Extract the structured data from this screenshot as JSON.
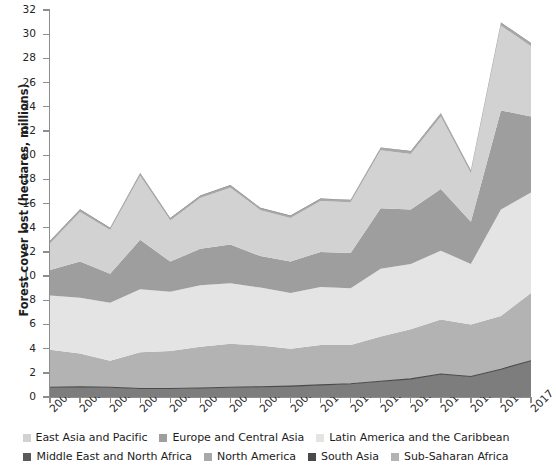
{
  "chart_data": {
    "type": "area",
    "stacked": true,
    "title": "",
    "xlabel": "",
    "ylabel": "Forest cover lost (hectares, millions)",
    "ylim": [
      0,
      32
    ],
    "ytick_step": 2,
    "yticks": [
      "0",
      "2",
      "4",
      "6",
      "8",
      "10",
      "12",
      "14",
      "16",
      "18",
      "20",
      "22",
      "24",
      "26",
      "28",
      "30",
      "32"
    ],
    "grid": false,
    "legend_position": "bottom",
    "categories": [
      "2001",
      "2002",
      "2003",
      "2004",
      "2005",
      "2006",
      "2007",
      "2008",
      "2009",
      "2010",
      "2011",
      "2012",
      "2013",
      "2014",
      "2015",
      "2016",
      "2017"
    ],
    "x": [
      2001,
      2002,
      2003,
      2004,
      2005,
      2006,
      2007,
      2008,
      2009,
      2010,
      2011,
      2012,
      2013,
      2014,
      2015,
      2016,
      2017
    ],
    "series": [
      {
        "name": "South Asia",
        "color": "#7d7d7d",
        "values": [
          0.8,
          0.85,
          0.8,
          0.7,
          0.7,
          0.75,
          0.8,
          0.85,
          0.9,
          1.0,
          1.1,
          1.3,
          1.5,
          1.9,
          1.7,
          2.3,
          3.0
        ]
      },
      {
        "name": "Sub-Saharan Africa",
        "color": "#b3b3b3",
        "values": [
          3.1,
          2.75,
          2.2,
          3.0,
          3.1,
          3.4,
          3.6,
          3.4,
          3.1,
          3.3,
          3.2,
          3.7,
          4.1,
          4.5,
          4.3,
          4.4,
          5.6
        ]
      },
      {
        "name": "Latin America and the Caribbean",
        "color": "#e4e4e4",
        "values": [
          4.5,
          4.6,
          4.8,
          5.2,
          4.9,
          5.1,
          5.0,
          4.8,
          4.6,
          4.8,
          4.7,
          5.6,
          5.4,
          5.7,
          5.0,
          8.8,
          8.3
        ]
      },
      {
        "name": "Europe and Central Asia",
        "color": "#9e9e9e",
        "values": [
          2.1,
          3.0,
          2.4,
          4.1,
          2.5,
          3.0,
          3.2,
          2.6,
          2.6,
          2.9,
          2.9,
          5.0,
          4.5,
          5.1,
          3.5,
          8.2,
          6.3
        ]
      },
      {
        "name": "East Asia and Pacific",
        "color": "#d2d2d2",
        "values": [
          2.2,
          4.1,
          3.6,
          5.3,
          3.4,
          4.2,
          4.7,
          3.8,
          3.6,
          4.2,
          4.2,
          4.8,
          4.6,
          6.0,
          4.0,
          7.0,
          5.8
        ]
      },
      {
        "name": "North America",
        "color": "#a8a8a8",
        "values": [
          0.18,
          0.18,
          0.16,
          0.18,
          0.16,
          0.18,
          0.18,
          0.16,
          0.16,
          0.18,
          0.18,
          0.2,
          0.2,
          0.22,
          0.2,
          0.22,
          0.24
        ]
      },
      {
        "name": "Middle East and North Africa",
        "color": "#5a5a5a",
        "values": [
          0.04,
          0.04,
          0.04,
          0.04,
          0.04,
          0.04,
          0.04,
          0.04,
          0.04,
          0.04,
          0.04,
          0.04,
          0.04,
          0.04,
          0.04,
          0.04,
          0.04
        ]
      }
    ],
    "totals": [
      12.92,
      15.52,
      14.0,
      18.52,
      14.8,
      16.67,
      17.52,
      15.65,
      15.0,
      16.42,
      16.32,
      20.64,
      20.34,
      23.46,
      18.74,
      30.96,
      29.28
    ]
  },
  "legend": {
    "row1": [
      {
        "label": "East Asia and Pacific",
        "color": "#d2d2d2"
      },
      {
        "label": "Europe and Central Asia",
        "color": "#9e9e9e"
      },
      {
        "label": "Latin America and the Caribbean",
        "color": "#e4e4e4"
      }
    ],
    "row2": [
      {
        "label": "Middle East and North Africa",
        "color": "#5a5a5a"
      },
      {
        "label": "North America",
        "color": "#a8a8a8"
      },
      {
        "label": "South Asia",
        "color": "#4a4a4a"
      },
      {
        "label": "Sub-Saharan Africa",
        "color": "#b3b3b3"
      }
    ]
  },
  "axis": {
    "y_title": "Forest cover lost (hectares, millions)",
    "axis_color": "#8d8d8d"
  }
}
